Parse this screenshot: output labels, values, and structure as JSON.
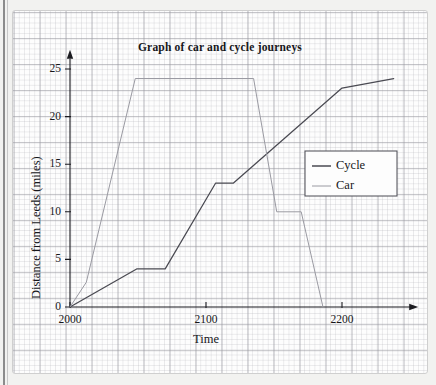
{
  "chart_data": {
    "type": "line",
    "title": "Graph of car and cycle journeys",
    "xlabel": "Time",
    "ylabel": "Distance from Leeds (miles)",
    "xlim": [
      2000,
      2245
    ],
    "ylim": [
      0,
      26.5
    ],
    "xticks": [
      "2000",
      "2100",
      "2200"
    ],
    "xtick_values": [
      2000,
      2100,
      2200
    ],
    "yticks": [
      "0",
      "5",
      "10",
      "15",
      "20",
      "25"
    ],
    "ytick_values": [
      0,
      5,
      10,
      15,
      20,
      25
    ],
    "grid": true,
    "grid_style": "graph-paper",
    "legend_position": "center-right",
    "series": [
      {
        "name": "Cycle",
        "color": "#4a4a52",
        "points": [
          {
            "x": 2000,
            "y": 0
          },
          {
            "x": 2049,
            "y": 4
          },
          {
            "x": 2070,
            "y": 4
          },
          {
            "x": 2107,
            "y": 13
          },
          {
            "x": 2120,
            "y": 13
          },
          {
            "x": 2200,
            "y": 23
          },
          {
            "x": 2238,
            "y": 24
          }
        ]
      },
      {
        "name": "Car",
        "color": "#9a9aa2",
        "points": [
          {
            "x": 2000,
            "y": 0
          },
          {
            "x": 2012,
            "y": 2.6
          },
          {
            "x": 2048,
            "y": 24
          },
          {
            "x": 2135,
            "y": 24
          },
          {
            "x": 2152,
            "y": 10
          },
          {
            "x": 2170,
            "y": 10
          },
          {
            "x": 2186,
            "y": 0
          }
        ]
      }
    ],
    "annotations": []
  },
  "legend": {
    "entries": [
      {
        "label": "Cycle",
        "color": "#4a4a52"
      },
      {
        "label": "Car",
        "color": "#9a9aa2"
      }
    ]
  }
}
